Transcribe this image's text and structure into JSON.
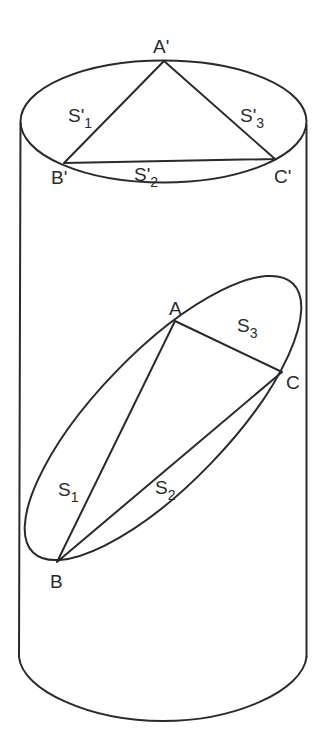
{
  "diagram": {
    "type": "geometry",
    "colors": {
      "stroke": "#2a2a2a",
      "background": "#ffffff"
    },
    "top_face": {
      "vertices": {
        "A_prime": {
          "label": "A'",
          "x": 164,
          "y": 61
        },
        "B_prime": {
          "label": "B'",
          "x": 64,
          "y": 163
        },
        "C_prime": {
          "label": "C'",
          "x": 275,
          "y": 159
        }
      },
      "sides": {
        "s1": {
          "main": "S'",
          "sub": "1"
        },
        "s2": {
          "main": "S'",
          "sub": "2"
        },
        "s3": {
          "main": "S'",
          "sub": "3"
        }
      }
    },
    "section": {
      "vertices": {
        "A": {
          "label": "A",
          "x": 175,
          "y": 321
        },
        "B": {
          "label": "B",
          "x": 57,
          "y": 562
        },
        "C": {
          "label": "C",
          "x": 282,
          "y": 372
        }
      },
      "sides": {
        "s1": {
          "main": "S",
          "sub": "1"
        },
        "s2": {
          "main": "S",
          "sub": "2"
        },
        "s3": {
          "main": "S",
          "sub": "3"
        }
      }
    }
  }
}
